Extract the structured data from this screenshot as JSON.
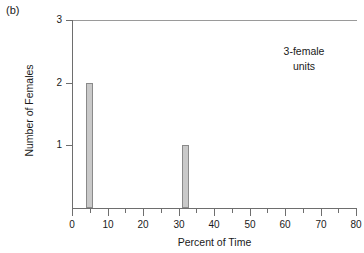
{
  "panel_label": "(b)",
  "annotation": {
    "line1": "3-female",
    "line2": "units"
  },
  "chart_data": {
    "type": "bar",
    "title": "",
    "subtitle": "",
    "xlabel": "Percent of Time",
    "ylabel": "Number of Females",
    "xlim": [
      0,
      80
    ],
    "ylim": [
      0,
      3
    ],
    "grid": false,
    "legend": null,
    "x_major_ticks": [
      0,
      10,
      20,
      30,
      40,
      50,
      60,
      70,
      80
    ],
    "x_major_tick_labels": [
      "0",
      "10",
      "20",
      "30",
      "40",
      "50",
      "60",
      "70",
      "80"
    ],
    "x_minor_ticks": [
      5,
      15,
      25,
      35,
      45,
      55,
      65,
      75
    ],
    "y_ticks": [
      1,
      2,
      3
    ],
    "y_tick_labels": [
      "1",
      "2",
      "3"
    ],
    "bar_fill_color": "#c9c9c9",
    "bar_edge_color": "#8a8a8a",
    "axis_color": "#6e6e6e",
    "bars": [
      {
        "x_start": 4,
        "x_end": 6,
        "center": 5,
        "value": 2
      },
      {
        "x_start": 31,
        "x_end": 33,
        "center": 32,
        "value": 1
      }
    ],
    "categories": [
      "5",
      "32"
    ],
    "values": [
      2,
      1
    ],
    "annotations": [
      {
        "text": "3-female units",
        "x": 62,
        "y": 2.55
      }
    ]
  }
}
